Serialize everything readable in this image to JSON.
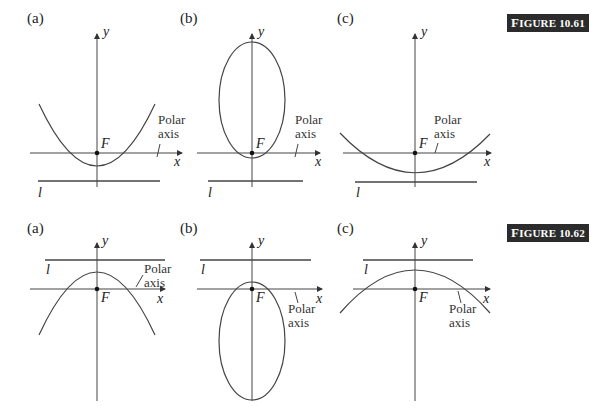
{
  "figures": [
    {
      "label": "FIGURE 10.61",
      "label_first": "F",
      "label_rest": "IGURE 10.61",
      "panels": [
        {
          "tag": "(a)",
          "conic": "parabola opening up",
          "directrix_label": "l",
          "focus_label": "F",
          "x_label": "x",
          "y_label": "y",
          "polar_label_1": "Polar",
          "polar_label_2": "axis"
        },
        {
          "tag": "(b)",
          "conic": "ellipse above focus",
          "directrix_label": "l",
          "focus_label": "F",
          "x_label": "x",
          "y_label": "y",
          "polar_label_1": "Polar",
          "polar_label_2": "axis"
        },
        {
          "tag": "(c)",
          "conic": "hyperbola branch opening up",
          "directrix_label": "l",
          "focus_label": "F",
          "x_label": "x",
          "y_label": "y",
          "polar_label_1": "Polar",
          "polar_label_2": "axis"
        }
      ]
    },
    {
      "label": "FIGURE 10.62",
      "label_first": "F",
      "label_rest": "IGURE 10.62",
      "panels": [
        {
          "tag": "(a)",
          "conic": "parabola opening down",
          "directrix_label": "l",
          "focus_label": "F",
          "x_label": "x",
          "y_label": "y",
          "polar_label_1": "Polar",
          "polar_label_2": "axis"
        },
        {
          "tag": "(b)",
          "conic": "ellipse below focus",
          "directrix_label": "l",
          "focus_label": "F",
          "x_label": "x",
          "y_label": "y",
          "polar_label_1": "Polar",
          "polar_label_2": "axis"
        },
        {
          "tag": "(c)",
          "conic": "hyperbola branch opening down",
          "directrix_label": "l",
          "focus_label": "F",
          "x_label": "x",
          "y_label": "y",
          "polar_label_1": "Polar",
          "polar_label_2": "axis"
        }
      ]
    }
  ],
  "colors": {
    "stroke": "#333333",
    "label_bg": "#2b2b2b",
    "label_fg": "#ffffff"
  }
}
